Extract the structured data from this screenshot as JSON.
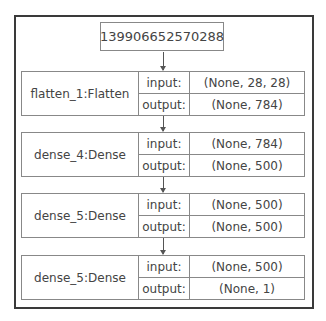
{
  "diagram": {
    "input_node": {
      "label": "139906652570288"
    },
    "port_labels": {
      "input": "input:",
      "output": "output:"
    },
    "layers": [
      {
        "name": "flatten_1:Flatten",
        "input": "(None, 28, 28)",
        "output": "(None, 784)"
      },
      {
        "name": "dense_4:Dense",
        "input": "(None, 784)",
        "output": "(None, 500)"
      },
      {
        "name": "dense_5:Dense",
        "input": "(None, 500)",
        "output": "(None, 500)"
      },
      {
        "name": "dense_5:Dense",
        "input": "(None, 500)",
        "output": "(None, 1)"
      }
    ]
  }
}
